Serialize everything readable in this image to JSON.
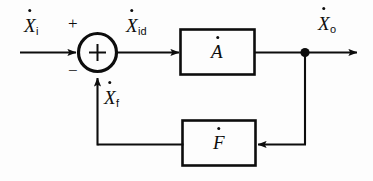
{
  "figure": {
    "type": "block-diagram",
    "background_color": "#fdfdfd",
    "line_color": "#0d0d0d"
  },
  "signals": {
    "input": {
      "base": "X",
      "sub": "i",
      "dot": true,
      "text": "Ẋi"
    },
    "error": {
      "base": "X",
      "sub": "id",
      "dot": true,
      "text": "Ẋid"
    },
    "feedback": {
      "base": "X",
      "sub": "f",
      "dot": true,
      "text": "Ẋf"
    },
    "output": {
      "base": "X",
      "sub": "o",
      "dot": true,
      "text": "Ẋo"
    }
  },
  "summing_junction": {
    "name": "summing-junction",
    "inner_symbol": "+",
    "input_sign": "+",
    "feedback_sign": "−"
  },
  "blocks": [
    {
      "id": "forward",
      "label": "A",
      "dot": true,
      "text": "Ȧ"
    },
    {
      "id": "feedback",
      "label": "F",
      "dot": true,
      "text": "Ḟ"
    }
  ],
  "nodes": {
    "takeoff": {
      "name": "takeoff-node",
      "shape": "filled-circle"
    }
  }
}
